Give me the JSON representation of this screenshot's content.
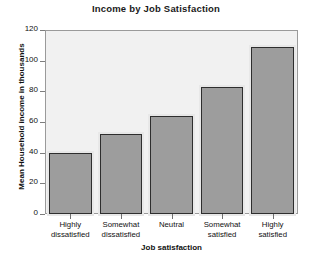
{
  "chart_data": {
    "type": "bar",
    "title": "Income by Job Satisfaction",
    "xlabel": "Job satisfaction",
    "ylabel": "Mean Household income in thousands",
    "categories": [
      "Highly dissatisfied",
      "Somewhat dissatisfied",
      "Neutral",
      "Somewhat satisfied",
      "Highly satisfied"
    ],
    "category_lines": [
      [
        "Highly",
        "dissatisfied"
      ],
      [
        "Somewhat",
        "dissatisfied"
      ],
      [
        "Neutral",
        ""
      ],
      [
        "Somewhat",
        "satisfied"
      ],
      [
        "Highly",
        "satisfied"
      ]
    ],
    "values": [
      40,
      52,
      64,
      83,
      109
    ],
    "ylim": [
      0,
      120
    ],
    "yticks": [
      0,
      20,
      40,
      60,
      80,
      100,
      120
    ],
    "ytick_labels": [
      "0",
      "20",
      "40",
      "60",
      "80",
      "100",
      "120"
    ],
    "grid": false,
    "legend": false,
    "colors": {
      "bar_fill": "#9d9d9d",
      "bar_border": "#2e2e2e",
      "bar_halo": "#e8e8e8",
      "plot_background": "#f1f1f1",
      "plot_frame": "#9a9a9a",
      "canvas_background": "#ffffff",
      "text": "#111111"
    }
  }
}
